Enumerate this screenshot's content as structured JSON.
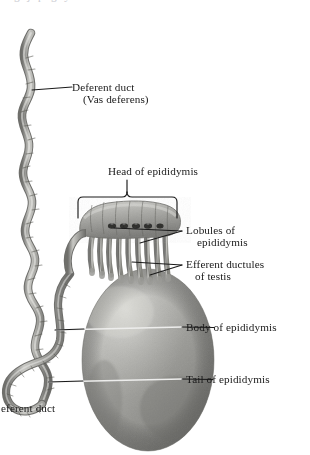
{
  "figure": {
    "title_clipped_top": "g j p g y",
    "background_color": "#ffffff",
    "ink_color": "#1a1a1a",
    "width": 310,
    "height": 455
  },
  "labels": {
    "deferent_duct": {
      "line1": "Deferent duct",
      "line2": "(Vas deferens)"
    },
    "head_of_epididymis": {
      "line1": "Head of epididymis"
    },
    "lobules_of_epididymis": {
      "line1": "Lobules of",
      "line2": "epididymis"
    },
    "efferent_ductules": {
      "line1": "Efferent ductules",
      "line2": "of testis"
    },
    "body_of_epididymis": {
      "line1": "Body of epididymis"
    },
    "tail_of_epididymis": {
      "line1": "Tail of epididymis"
    },
    "deferent_duct_lower": {
      "line1": "eferent duct"
    }
  },
  "structures": {
    "vas_deferens": "coiled-duct",
    "epididymis_head": "lobulated-cap",
    "efferent_ductules": "finger-like-tubules",
    "testis": "gray-ovoid"
  },
  "colors": {
    "tissue_mid": "#9a9a97",
    "tissue_dark": "#5d5d5b",
    "tissue_light": "#d2d2cf",
    "leader_line": "#1a1a1a",
    "leader_line_over_testis": "#ececeb"
  }
}
